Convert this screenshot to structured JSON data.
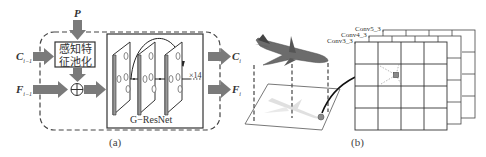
{
  "panel_a": {
    "caption": "(a)",
    "input_p": "P",
    "input_c": {
      "base": "C",
      "sub": "i−1"
    },
    "input_f": {
      "base": "F",
      "sub": "i−1"
    },
    "output_c": {
      "base": "C",
      "sub": "i"
    },
    "output_f": {
      "base": "F",
      "sub": "i"
    },
    "pooling_block_line1": "感知特",
    "pooling_block_line2": "征池化",
    "sum_symbol": "⊕",
    "resnet_label": "G−ResNet",
    "repeat_label": "×14"
  },
  "panel_b": {
    "caption": "(b)",
    "layers": [
      "Conv5_3",
      "Conv4_3",
      "Conv3_3"
    ],
    "grid_rows": 4,
    "grid_cols": 4
  },
  "colors": {
    "arrow": "#7a7a7a",
    "line": "#333333",
    "dashed": "#444444",
    "point": "#8a8a8a"
  }
}
